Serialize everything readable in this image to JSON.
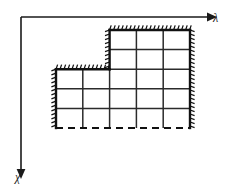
{
  "figure": {
    "kind": "staircase-domain-diagram",
    "background_color": "#ffffff",
    "line_color": "#111111",
    "canvas": {
      "width": 231,
      "height": 188
    }
  },
  "axes": {
    "origin": {
      "x": 21,
      "y": 17
    },
    "horizontal": {
      "name": "lambda-axis",
      "label": "λ",
      "label_x": 213,
      "label_y": 22,
      "direction": "right",
      "end_x": 208,
      "y": 17,
      "arrow": "arrow-right-icon"
    },
    "vertical": {
      "name": "chi-axis",
      "label": "χ",
      "label_x": 15,
      "label_y": 181,
      "direction": "down",
      "end_y": 170,
      "x": 21,
      "arrow": "arrow-down-icon"
    }
  },
  "domain": {
    "name": "step-region",
    "description": "L-shaped staircase grid region",
    "cell_width": 26.8,
    "cell_height": 19.6,
    "columns": 5,
    "rows": 5,
    "column_x": [
      56.0,
      82.8,
      109.6,
      136.4,
      163.2,
      190.0
    ],
    "row_y": [
      30.0,
      49.6,
      69.2,
      88.8,
      108.4,
      128.0
    ],
    "top_profile": [
      2,
      2,
      0,
      0,
      0
    ],
    "outline_points": "109.6,30.0 190.0,30.0 190.0,128.0 56.0,128.0 56.0,69.2 109.6,69.2",
    "boundary_segments": [
      {
        "name": "top-edge-upper",
        "style": "solid-hatched",
        "x1": 109.6,
        "y1": 30.0,
        "x2": 190.0,
        "y2": 30.0,
        "hatch_side": "up"
      },
      {
        "name": "right-edge",
        "style": "solid-hatched",
        "x1": 190.0,
        "y1": 30.0,
        "x2": 190.0,
        "y2": 128.0,
        "hatch_side": "right"
      },
      {
        "name": "bottom-edge",
        "style": "dashed",
        "x1": 56.0,
        "y1": 128.0,
        "x2": 190.0,
        "y2": 128.0,
        "hatch_side": "none"
      },
      {
        "name": "left-edge",
        "style": "solid-hatched",
        "x1": 56.0,
        "y1": 69.2,
        "x2": 56.0,
        "y2": 128.0,
        "hatch_side": "left"
      },
      {
        "name": "top-edge-lower",
        "style": "solid-hatched",
        "x1": 56.0,
        "y1": 69.2,
        "x2": 109.6,
        "y2": 69.2,
        "hatch_side": "up"
      },
      {
        "name": "step-edge-vertical",
        "style": "solid-hatched",
        "x1": 109.6,
        "y1": 30.0,
        "x2": 109.6,
        "y2": 69.2,
        "hatch_side": "left"
      }
    ],
    "interior_horizontal_lines": [
      {
        "y": 49.6,
        "x1": 109.6,
        "x2": 190.0
      },
      {
        "y": 69.2,
        "x1": 109.6,
        "x2": 190.0
      },
      {
        "y": 88.8,
        "x1": 56.0,
        "x2": 190.0
      },
      {
        "y": 108.4,
        "x1": 56.0,
        "x2": 190.0
      }
    ],
    "interior_vertical_lines": [
      {
        "x": 82.8,
        "y1": 69.2,
        "y2": 128.0
      },
      {
        "x": 109.6,
        "y1": 69.2,
        "y2": 128.0
      },
      {
        "x": 136.4,
        "y1": 30.0,
        "y2": 128.0
      },
      {
        "x": 163.2,
        "y1": 30.0,
        "y2": 128.0
      }
    ],
    "hatch": {
      "length": 4.6,
      "spacing": 4.0,
      "slant": 1.6
    }
  }
}
